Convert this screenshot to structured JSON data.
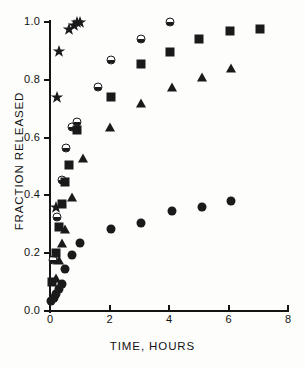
{
  "chart_data": {
    "type": "scatter",
    "title": "",
    "xlabel": "TIME, HOURS",
    "ylabel": "FRACTION RELEASED",
    "xlim": [
      0,
      8
    ],
    "ylim": [
      0.0,
      1.0
    ],
    "xticks": [
      0,
      2,
      4,
      6,
      8
    ],
    "xtick_labels": [
      "0",
      "2",
      "4",
      "6",
      "8"
    ],
    "yticks": [
      0.0,
      0.2,
      0.4,
      0.6,
      0.8,
      1.0
    ],
    "ytick_labels": [
      "0.0",
      "0.2",
      "0.4",
      "0.6",
      "0.8",
      "1.0"
    ],
    "grid": false,
    "legend": "none",
    "marker_color": "#1a1a1a",
    "series": [
      {
        "name": "star-series",
        "marker": "star",
        "points": [
          {
            "x": 0.2,
            "y": 0.36
          },
          {
            "x": 0.25,
            "y": 0.74
          },
          {
            "x": 0.3,
            "y": 0.9
          },
          {
            "x": 0.65,
            "y": 0.975
          },
          {
            "x": 0.8,
            "y": 0.99
          },
          {
            "x": 0.9,
            "y": 1.0
          },
          {
            "x": 1.0,
            "y": 1.0
          }
        ]
      },
      {
        "name": "half-circle-series",
        "marker": "half-circle",
        "points": [
          {
            "x": 0.1,
            "y": 0.175
          },
          {
            "x": 0.25,
            "y": 0.325
          },
          {
            "x": 0.4,
            "y": 0.455
          },
          {
            "x": 0.55,
            "y": 0.565
          },
          {
            "x": 0.75,
            "y": 0.635
          },
          {
            "x": 0.9,
            "y": 0.655
          },
          {
            "x": 1.6,
            "y": 0.775
          },
          {
            "x": 2.05,
            "y": 0.87
          },
          {
            "x": 3.05,
            "y": 0.94
          },
          {
            "x": 4.05,
            "y": 1.0
          }
        ]
      },
      {
        "name": "square-series",
        "marker": "square",
        "points": [
          {
            "x": 0.08,
            "y": 0.1
          },
          {
            "x": 0.2,
            "y": 0.2
          },
          {
            "x": 0.3,
            "y": 0.29
          },
          {
            "x": 0.4,
            "y": 0.37
          },
          {
            "x": 0.5,
            "y": 0.445
          },
          {
            "x": 0.65,
            "y": 0.505
          },
          {
            "x": 0.9,
            "y": 0.625
          },
          {
            "x": 2.05,
            "y": 0.74
          },
          {
            "x": 3.05,
            "y": 0.855
          },
          {
            "x": 4.05,
            "y": 0.895
          },
          {
            "x": 5.0,
            "y": 0.94
          },
          {
            "x": 6.05,
            "y": 0.97
          },
          {
            "x": 7.05,
            "y": 0.975
          }
        ]
      },
      {
        "name": "triangle-series",
        "marker": "triangle",
        "points": [
          {
            "x": 0.2,
            "y": 0.115
          },
          {
            "x": 0.3,
            "y": 0.175
          },
          {
            "x": 0.4,
            "y": 0.235
          },
          {
            "x": 0.5,
            "y": 0.285
          },
          {
            "x": 0.75,
            "y": 0.395
          },
          {
            "x": 1.1,
            "y": 0.53
          },
          {
            "x": 2.0,
            "y": 0.635
          },
          {
            "x": 3.05,
            "y": 0.72
          },
          {
            "x": 4.1,
            "y": 0.775
          },
          {
            "x": 5.1,
            "y": 0.81
          },
          {
            "x": 6.1,
            "y": 0.84
          }
        ]
      },
      {
        "name": "filled-circle-series",
        "marker": "circle",
        "points": [
          {
            "x": 0.05,
            "y": 0.035
          },
          {
            "x": 0.12,
            "y": 0.045
          },
          {
            "x": 0.2,
            "y": 0.06
          },
          {
            "x": 0.3,
            "y": 0.075
          },
          {
            "x": 0.4,
            "y": 0.095
          },
          {
            "x": 0.5,
            "y": 0.145
          },
          {
            "x": 0.75,
            "y": 0.195
          },
          {
            "x": 1.0,
            "y": 0.235
          },
          {
            "x": 2.05,
            "y": 0.285
          },
          {
            "x": 3.05,
            "y": 0.305
          },
          {
            "x": 4.1,
            "y": 0.345
          },
          {
            "x": 5.1,
            "y": 0.36
          },
          {
            "x": 6.1,
            "y": 0.38
          }
        ]
      }
    ]
  }
}
